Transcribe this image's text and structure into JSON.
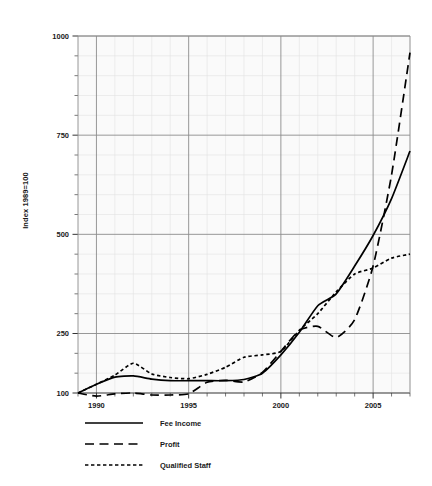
{
  "chart_data": {
    "type": "line",
    "title": "",
    "subtitle": "",
    "xlabel": "",
    "ylabel": "Index 1989=100",
    "xlim": [
      1989,
      2007
    ],
    "ylim": [
      100,
      1000
    ],
    "grid": true,
    "grid_axes": "both",
    "legend_position": "below-left",
    "x_ticks_major": [
      1990,
      1995,
      2000,
      2005
    ],
    "x_tick_labels": [
      "1990",
      "1995",
      "2000",
      "2005"
    ],
    "x_ticks_minor": [
      1989,
      1991,
      1992,
      1993,
      1994,
      1996,
      1997,
      1998,
      1999,
      2001,
      2002,
      2003,
      2004,
      2006,
      2007
    ],
    "y_ticks_major": [
      100,
      250,
      500,
      750,
      1000
    ],
    "y_tick_labels": [
      "100",
      "250",
      "500",
      "750",
      "1000"
    ],
    "y_ticks_minor": [
      150,
      200,
      300,
      350,
      400,
      450,
      550,
      600,
      650,
      700,
      800,
      850,
      900,
      950
    ],
    "x": [
      1989,
      1990,
      1991,
      1992,
      1993,
      1994,
      1995,
      1996,
      1997,
      1998,
      1999,
      2000,
      2001,
      2002,
      2003,
      2004,
      2005,
      2006,
      2007
    ],
    "series": [
      {
        "name": "Fee Income",
        "style": "solid",
        "color": "#000000",
        "values": [
          100,
          122,
          140,
          143,
          135,
          131,
          131,
          131,
          131,
          134,
          150,
          196,
          253,
          320,
          350,
          420,
          497,
          590,
          710
        ]
      },
      {
        "name": "Profit",
        "style": "long-dash",
        "color": "#000000",
        "values": [
          100,
          92,
          98,
          100,
          95,
          95,
          98,
          127,
          132,
          128,
          152,
          205,
          258,
          268,
          240,
          285,
          420,
          650,
          958
        ]
      },
      {
        "name": "Qualified Staff",
        "style": "short-dash",
        "color": "#000000",
        "values": [
          100,
          122,
          145,
          175,
          148,
          139,
          136,
          147,
          165,
          190,
          196,
          205,
          258,
          300,
          355,
          400,
          415,
          440,
          450
        ]
      }
    ]
  },
  "legend": {
    "items": [
      {
        "label": "Fee Income",
        "style": "solid"
      },
      {
        "label": "Profit",
        "style": "long-dash"
      },
      {
        "label": "Qualified Staff",
        "style": "short-dash"
      }
    ]
  },
  "colors": {
    "ink": "#000000",
    "grid_major": "#8c8c8c",
    "grid_minor": "#e3e3e3",
    "plot_background": "#fafafa",
    "axis": "#6b6b6b"
  }
}
